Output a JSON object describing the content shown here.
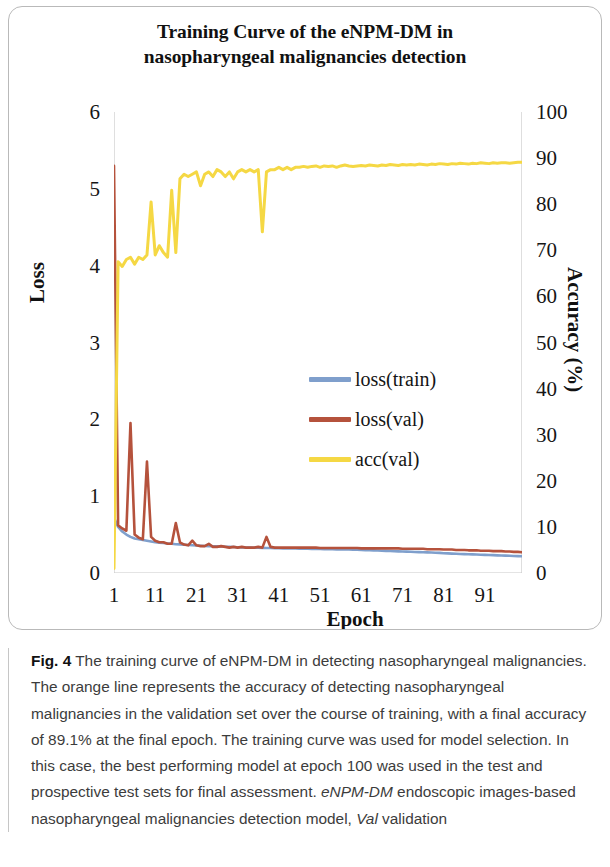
{
  "figure": {
    "title": "Training Curve of the eNPM-DM in\nnasopharyngeal malignancies detection",
    "caption_label": "Fig. 4",
    "caption_part1": " The training curve of eNPM-DM in detecting nasopharyngeal malignancies. The orange line represents the accuracy of detecting nasopharyngeal malignancies in the validation set over the course of training, with a final accuracy of 89.1% at the final epoch. The training curve was used for model selection. In this case, the best performing model at epoch 100 was used in the test and prospective test sets for final assessment. ",
    "caption_italic1": "eNPM-DM",
    "caption_part2": " endoscopic images-based nasopharyngeal malignancies detection model, ",
    "caption_italic2": "Val",
    "caption_part3": " validation"
  },
  "legend": {
    "items": [
      {
        "label": "loss(train)",
        "color": "#7f9fcc"
      },
      {
        "label": "loss(val)",
        "color": "#b5523c"
      },
      {
        "label": "acc(val)",
        "color": "#f5d844"
      }
    ]
  },
  "chart_data": {
    "type": "line",
    "title": "Training Curve of the eNPM-DM in nasopharyngeal malignancies detection",
    "xlabel": "Epoch",
    "ylabel": "Loss",
    "y2label": "Accuracy (%)",
    "grid": false,
    "legend_position": "center",
    "xlim": [
      1,
      100
    ],
    "xticks": [
      1,
      11,
      21,
      31,
      41,
      51,
      61,
      71,
      81,
      91
    ],
    "ylim": [
      0,
      6
    ],
    "yticks": [
      0,
      1,
      2,
      3,
      4,
      5,
      6
    ],
    "y2lim": [
      0,
      100
    ],
    "y2ticks": [
      0,
      10,
      20,
      30,
      40,
      50,
      60,
      70,
      80,
      90,
      100
    ],
    "x": [
      1,
      2,
      3,
      4,
      5,
      6,
      7,
      8,
      9,
      10,
      11,
      12,
      13,
      14,
      15,
      16,
      17,
      18,
      19,
      20,
      21,
      22,
      23,
      24,
      25,
      26,
      27,
      28,
      29,
      30,
      31,
      32,
      33,
      34,
      35,
      36,
      37,
      38,
      39,
      40,
      41,
      42,
      43,
      44,
      45,
      46,
      47,
      48,
      49,
      50,
      51,
      52,
      53,
      54,
      55,
      56,
      57,
      58,
      59,
      60,
      61,
      62,
      63,
      64,
      65,
      66,
      67,
      68,
      69,
      70,
      71,
      72,
      73,
      74,
      75,
      76,
      77,
      78,
      79,
      80,
      81,
      82,
      83,
      84,
      85,
      86,
      87,
      88,
      89,
      90,
      91,
      92,
      93,
      94,
      95,
      96,
      97,
      98,
      99,
      100
    ],
    "series": [
      {
        "name": "loss(train)",
        "axis": "left",
        "color": "#7f9fcc",
        "values": [
          0.72,
          0.6,
          0.54,
          0.5,
          0.47,
          0.45,
          0.44,
          0.43,
          0.42,
          0.41,
          0.4,
          0.395,
          0.39,
          0.385,
          0.38,
          0.375,
          0.372,
          0.368,
          0.365,
          0.362,
          0.358,
          0.355,
          0.352,
          0.35,
          0.348,
          0.346,
          0.344,
          0.342,
          0.34,
          0.338,
          0.336,
          0.334,
          0.332,
          0.33,
          0.329,
          0.328,
          0.327,
          0.326,
          0.325,
          0.324,
          0.322,
          0.321,
          0.32,
          0.319,
          0.318,
          0.317,
          0.316,
          0.315,
          0.314,
          0.313,
          0.312,
          0.311,
          0.31,
          0.309,
          0.308,
          0.307,
          0.306,
          0.305,
          0.304,
          0.303,
          0.3,
          0.298,
          0.296,
          0.294,
          0.292,
          0.29,
          0.288,
          0.286,
          0.284,
          0.282,
          0.28,
          0.278,
          0.276,
          0.274,
          0.272,
          0.27,
          0.268,
          0.266,
          0.264,
          0.262,
          0.258,
          0.255,
          0.252,
          0.25,
          0.248,
          0.246,
          0.244,
          0.242,
          0.24,
          0.238,
          0.236,
          0.234,
          0.232,
          0.23,
          0.228,
          0.226,
          0.224,
          0.222,
          0.22,
          0.218
        ]
      },
      {
        "name": "loss(val)",
        "axis": "left",
        "color": "#b5523c",
        "values": [
          5.3,
          0.62,
          0.58,
          0.55,
          1.95,
          0.5,
          0.46,
          0.44,
          1.45,
          0.47,
          0.42,
          0.4,
          0.4,
          0.38,
          0.38,
          0.65,
          0.4,
          0.37,
          0.36,
          0.42,
          0.36,
          0.35,
          0.35,
          0.38,
          0.34,
          0.34,
          0.35,
          0.34,
          0.33,
          0.34,
          0.33,
          0.34,
          0.33,
          0.33,
          0.33,
          0.34,
          0.33,
          0.47,
          0.34,
          0.33,
          0.33,
          0.33,
          0.33,
          0.33,
          0.33,
          0.33,
          0.33,
          0.33,
          0.33,
          0.33,
          0.325,
          0.325,
          0.325,
          0.325,
          0.325,
          0.325,
          0.325,
          0.325,
          0.325,
          0.325,
          0.32,
          0.32,
          0.32,
          0.32,
          0.32,
          0.32,
          0.32,
          0.32,
          0.32,
          0.32,
          0.315,
          0.315,
          0.315,
          0.315,
          0.315,
          0.315,
          0.31,
          0.31,
          0.31,
          0.31,
          0.305,
          0.305,
          0.305,
          0.3,
          0.3,
          0.3,
          0.295,
          0.295,
          0.295,
          0.29,
          0.29,
          0.29,
          0.285,
          0.285,
          0.285,
          0.28,
          0.28,
          0.275,
          0.275,
          0.27
        ]
      },
      {
        "name": "acc(val)",
        "axis": "right",
        "color": "#f5d844",
        "values": [
          1.0,
          67.5,
          66.5,
          68.0,
          68.5,
          67.0,
          68.5,
          68.0,
          69.0,
          80.5,
          69.0,
          71.0,
          69.5,
          68.5,
          83.0,
          69.5,
          85.5,
          86.5,
          86.0,
          86.5,
          87.0,
          84.0,
          86.5,
          87.0,
          86.0,
          87.5,
          87.0,
          86.0,
          87.0,
          85.5,
          87.0,
          87.5,
          87.0,
          87.5,
          87.0,
          87.5,
          74.0,
          87.0,
          87.5,
          87.5,
          88.0,
          87.5,
          88.0,
          87.5,
          88.0,
          88.0,
          88.2,
          88.0,
          88.2,
          88.3,
          88.0,
          88.3,
          88.2,
          88.3,
          88.0,
          88.3,
          88.5,
          88.3,
          88.2,
          88.3,
          88.4,
          88.3,
          88.5,
          88.4,
          88.3,
          88.5,
          88.4,
          88.6,
          88.5,
          88.4,
          88.6,
          88.5,
          88.6,
          88.5,
          88.7,
          88.6,
          88.5,
          88.7,
          88.6,
          88.8,
          88.7,
          88.6,
          88.8,
          88.7,
          88.9,
          88.8,
          88.7,
          88.9,
          88.8,
          89.0,
          88.9,
          88.8,
          89.0,
          88.9,
          89.0,
          89.0,
          88.9,
          89.0,
          89.1,
          89.1
        ]
      }
    ]
  }
}
